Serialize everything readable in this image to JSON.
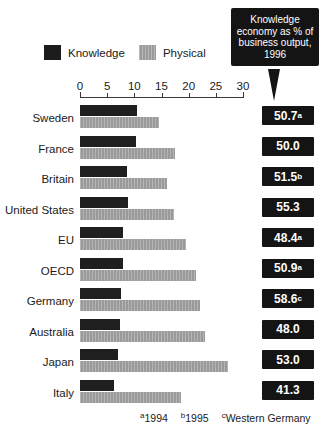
{
  "callout": {
    "text": "Knowledge economy as % of business output, 1996"
  },
  "legend": {
    "items": [
      {
        "label": "Knowledge",
        "color": "#1c1c1c",
        "icon": "square-swatch-icon"
      },
      {
        "label": "Physical",
        "color": "#9a9a9a",
        "icon": "square-swatch-icon"
      }
    ]
  },
  "footnotes": [
    {
      "marker": "a",
      "text": "1994"
    },
    {
      "marker": "b",
      "text": "1995"
    },
    {
      "marker": "c",
      "text": "Western Germany"
    }
  ],
  "chart_data": {
    "type": "bar",
    "title": "Knowledge economy as % of business output, 1996",
    "xlabel": "",
    "ylabel": "",
    "xlim": [
      0,
      30
    ],
    "ticks": [
      0,
      5,
      10,
      15,
      20,
      25,
      30
    ],
    "grid": false,
    "orientation": "horizontal",
    "legend_position": "top-left",
    "categories": [
      "Sweden",
      "France",
      "Britain",
      "United States",
      "EU",
      "OECD",
      "Germany",
      "Australia",
      "Japan",
      "Italy"
    ],
    "series": [
      {
        "name": "Knowledge",
        "color": "#1f1f1f",
        "values": [
          10.5,
          10.3,
          8.7,
          8.8,
          8.0,
          8.0,
          7.5,
          7.3,
          7.0,
          6.3
        ]
      },
      {
        "name": "Physical",
        "color": "#9a9a9a",
        "values": [
          14.5,
          17.5,
          16.0,
          17.3,
          19.6,
          21.3,
          22.0,
          23.0,
          27.3,
          18.5
        ]
      }
    ],
    "annotations": {
      "label": "Knowledge economy as % of business output, 1996",
      "values": [
        {
          "category": "Sweden",
          "value": "50.7",
          "footnote": "a"
        },
        {
          "category": "France",
          "value": "50.0",
          "footnote": ""
        },
        {
          "category": "Britain",
          "value": "51.5",
          "footnote": "b"
        },
        {
          "category": "United States",
          "value": "55.3",
          "footnote": ""
        },
        {
          "category": "EU",
          "value": "48.4",
          "footnote": "a"
        },
        {
          "category": "OECD",
          "value": "50.9",
          "footnote": "a"
        },
        {
          "category": "Germany",
          "value": "58.6",
          "footnote": "c"
        },
        {
          "category": "Australia",
          "value": "48.0",
          "footnote": ""
        },
        {
          "category": "Japan",
          "value": "53.0",
          "footnote": ""
        },
        {
          "category": "Italy",
          "value": "41.3",
          "footnote": ""
        }
      ]
    }
  }
}
